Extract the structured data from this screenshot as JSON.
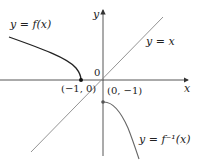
{
  "diagram": {
    "labels": {
      "f": "y = f(x)",
      "finv": "y = f⁻¹(x)",
      "identity": "y = x",
      "x_axis": "x",
      "y_axis": "y",
      "origin": "0",
      "point_f": "(−1, 0)",
      "point_finv": "(0, −1)"
    },
    "colors": {
      "curve": "#222222",
      "identity_line": "#777777",
      "axes": "#444444",
      "inverse_curve": "#666666"
    },
    "points": [
      {
        "name": "f-endpoint",
        "x": -1,
        "y": 0
      },
      {
        "name": "finv-endpoint",
        "x": 0,
        "y": -1
      }
    ]
  }
}
